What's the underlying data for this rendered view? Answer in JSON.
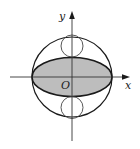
{
  "diagram": {
    "type": "geometry-figure",
    "labels": {
      "y_axis": "y",
      "x_axis": "x",
      "origin": "O"
    },
    "colors": {
      "stroke": "#1a1a1a",
      "ellipse_fill": "#bdbdbd",
      "background": "#ffffff"
    },
    "shapes": [
      {
        "kind": "circle",
        "name": "outer-circle",
        "cx": 72,
        "cy": 77,
        "r": 40
      },
      {
        "kind": "ellipse",
        "name": "shaded-ellipse",
        "cx": 72,
        "cy": 77,
        "rx": 40,
        "ry": 19.5,
        "shaded": true
      },
      {
        "kind": "circle",
        "name": "upper-small-circle",
        "cx": 72,
        "cy": 46,
        "r": 11
      },
      {
        "kind": "circle",
        "name": "lower-small-circle",
        "cx": 72,
        "cy": 107,
        "r": 11
      }
    ],
    "axes": {
      "x": {
        "from": 10,
        "to": 129,
        "y": 77
      },
      "y": {
        "from": 141,
        "to": 12,
        "x": 72
      }
    }
  }
}
